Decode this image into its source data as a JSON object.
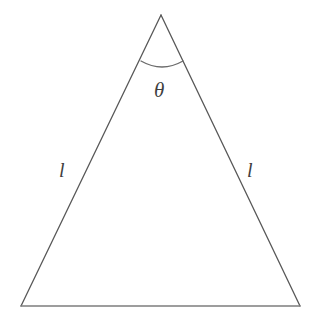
{
  "figure": {
    "kind": "geometry-diagram",
    "shape_name": "isosceles-triangle",
    "background_color": "#ffffff",
    "width": 316,
    "height": 328,
    "stroke": {
      "leg_color": "#585858",
      "base_color": "#7d7d7d",
      "arc_color": "#6b6b6b",
      "leg_width": 1.3,
      "base_width": 1.5,
      "arc_width": 1.3
    },
    "label_color": "#3f3f3f"
  },
  "labels": {
    "apex_angle": "θ",
    "leg_left": "l",
    "leg_right": "l"
  },
  "chart_data": {
    "type": "diagram",
    "title": "",
    "subtitle": "",
    "xlabel": "",
    "ylabel": "",
    "grid": false,
    "legend": "none",
    "shape": "isosceles triangle",
    "vertices": [
      {
        "name": "apex",
        "x": 161,
        "y": 15
      },
      {
        "name": "base-right",
        "x": 300,
        "y": 306
      },
      {
        "name": "base-left",
        "x": 21,
        "y": 306
      }
    ],
    "edges": [
      {
        "name": "left-leg",
        "from": "apex",
        "to": "base-left",
        "label": "l"
      },
      {
        "name": "right-leg",
        "from": "apex",
        "to": "base-right",
        "label": "l"
      },
      {
        "name": "base",
        "from": "base-left",
        "to": "base-right",
        "label": ""
      }
    ],
    "angle_markers": [
      {
        "name": "apex-angle",
        "at_vertex": "apex",
        "label": "θ",
        "arc_start": {
          "x": 141,
          "y": 61
        },
        "arc_end": {
          "x": 183,
          "y": 61
        },
        "arc_sag_y": 67,
        "label_position": {
          "x": 163,
          "y": 91
        }
      }
    ],
    "annotations": [
      {
        "text": "θ",
        "x": 163,
        "y": 91,
        "style": "italic-serif"
      },
      {
        "text": "l",
        "x": 64,
        "y": 171,
        "style": "italic-serif"
      },
      {
        "text": "l",
        "x": 252,
        "y": 171,
        "style": "italic-serif"
      }
    ]
  }
}
